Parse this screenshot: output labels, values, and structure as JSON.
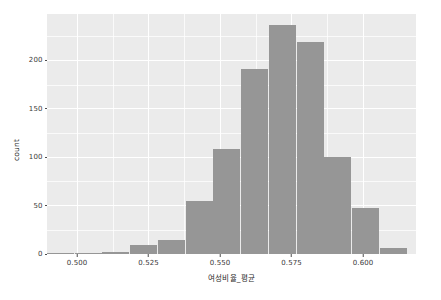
{
  "chart_data": {
    "type": "bar",
    "chart_subtype": "histogram",
    "title": "",
    "xlabel": "여성비율_평균",
    "ylabel": "count",
    "xlim": [
      0.4895,
      0.6185
    ],
    "ylim": [
      0,
      248
    ],
    "grid": true,
    "legend": null,
    "legend_position": "none",
    "bin_width": 0.00645,
    "x_ticks": [
      0.5,
      0.525,
      0.55,
      0.575,
      0.6
    ],
    "x_tick_labels": [
      "0.500",
      "0.525",
      "0.550",
      "0.575",
      "0.600"
    ],
    "x_minor_ticks": [
      0.5125,
      0.5375,
      0.5625,
      0.5875
    ],
    "y_ticks": [
      0,
      50,
      100,
      150,
      200
    ],
    "y_tick_labels": [
      "0",
      "50",
      "100",
      "150",
      "200"
    ],
    "y_minor_ticks": [
      25,
      75,
      125,
      175,
      225
    ],
    "bar_color": "#969696",
    "panel_color": "#ebebeb",
    "grid_color": "#ffffff",
    "bins": [
      {
        "x_left": 0.4895,
        "x_right": 0.4992,
        "center": 0.4944,
        "count": 1
      },
      {
        "x_left": 0.4992,
        "x_right": 0.5089,
        "center": 0.5041,
        "count": 1
      },
      {
        "x_left": 0.5089,
        "x_right": 0.5186,
        "center": 0.5138,
        "count": 2
      },
      {
        "x_left": 0.5186,
        "x_right": 0.5283,
        "center": 0.5235,
        "count": 9
      },
      {
        "x_left": 0.5283,
        "x_right": 0.538,
        "center": 0.5332,
        "count": 14
      },
      {
        "x_left": 0.538,
        "x_right": 0.5477,
        "center": 0.5429,
        "count": 55
      },
      {
        "x_left": 0.5477,
        "x_right": 0.5574,
        "center": 0.5526,
        "count": 109
      },
      {
        "x_left": 0.5574,
        "x_right": 0.5671,
        "center": 0.5623,
        "count": 191
      },
      {
        "x_left": 0.5671,
        "x_right": 0.5768,
        "center": 0.572,
        "count": 237
      },
      {
        "x_left": 0.5768,
        "x_right": 0.5865,
        "center": 0.5817,
        "count": 219
      },
      {
        "x_left": 0.5865,
        "x_right": 0.5962,
        "center": 0.5914,
        "count": 100
      },
      {
        "x_left": 0.5962,
        "x_right": 0.6059,
        "center": 0.6011,
        "count": 48
      },
      {
        "x_left": 0.6059,
        "x_right": 0.6156,
        "center": 0.6108,
        "count": 6
      }
    ],
    "categories": [
      "0.4944",
      "0.5041",
      "0.5138",
      "0.5235",
      "0.5332",
      "0.5429",
      "0.5526",
      "0.5623",
      "0.5720",
      "0.5817",
      "0.5914",
      "0.6011",
      "0.6108"
    ],
    "values": [
      1,
      1,
      2,
      9,
      14,
      55,
      109,
      191,
      237,
      219,
      100,
      48,
      6
    ]
  }
}
